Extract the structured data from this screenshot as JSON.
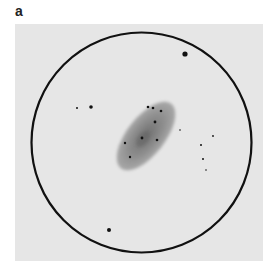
{
  "figure": {
    "panel_label": "a",
    "background_color": "#e6e6e6",
    "field_circle": {
      "cx": 141.5,
      "cy": 142.5,
      "r": 110,
      "stroke": "#111111",
      "stroke_width": 2.2
    },
    "galaxy": {
      "cx": 146,
      "cy": 136,
      "rx": 41,
      "ry": 19,
      "rotation_deg": -52,
      "color": "#8a8a8a",
      "core_color": "#666666"
    },
    "stars": [
      {
        "x": 185,
        "y": 54,
        "r": 2.6
      },
      {
        "x": 77,
        "y": 108,
        "r": 1.0
      },
      {
        "x": 91,
        "y": 107,
        "r": 1.8
      },
      {
        "x": 148,
        "y": 107,
        "r": 1.3
      },
      {
        "x": 153,
        "y": 108,
        "r": 1.3
      },
      {
        "x": 161,
        "y": 111,
        "r": 1.3
      },
      {
        "x": 155,
        "y": 122,
        "r": 1.4
      },
      {
        "x": 180,
        "y": 130,
        "r": 0.8
      },
      {
        "x": 213,
        "y": 136,
        "r": 0.9
      },
      {
        "x": 142,
        "y": 138,
        "r": 1.4
      },
      {
        "x": 157,
        "y": 140,
        "r": 1.3
      },
      {
        "x": 125,
        "y": 143,
        "r": 1.2
      },
      {
        "x": 201,
        "y": 145,
        "r": 1.0
      },
      {
        "x": 130,
        "y": 157,
        "r": 1.2
      },
      {
        "x": 203,
        "y": 159,
        "r": 1.0
      },
      {
        "x": 206,
        "y": 170,
        "r": 0.8
      },
      {
        "x": 109,
        "y": 230,
        "r": 2.0
      }
    ]
  }
}
